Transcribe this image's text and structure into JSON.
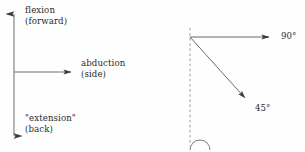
{
  "figure": {
    "name": "joint-motion-direction-diagram",
    "background_color": "#fefefe",
    "stroke_color": "#3a3a3a",
    "text_color": "#2b2b2b",
    "width": 305,
    "height": 152
  },
  "left_diagram": {
    "name": "axis-direction-diagram",
    "vertical_axis": {
      "name": "flexion-extension-axis",
      "x": 14,
      "y_top": 8,
      "y_bottom": 142,
      "arrowheads": "both"
    },
    "horizontal_axis": {
      "name": "abduction-axis",
      "y": 72,
      "x_start": 14,
      "x_end": 78,
      "arrowheads": "end"
    },
    "labels": {
      "flexion": {
        "line1": "flexion",
        "line2": "(forward)"
      },
      "abduction": {
        "line1": "abduction",
        "line2": "(side)"
      },
      "extension": {
        "line1": "\"extension\"",
        "line2": "(back)"
      }
    }
  },
  "right_diagram": {
    "name": "angle-measurement-diagram",
    "vertex": {
      "x": 190,
      "y": 37
    },
    "reference_line": {
      "name": "vertical-dashed-reference-line",
      "x": 190,
      "y_top": 28,
      "y_bottom": 145,
      "style": "dashed"
    },
    "rays": [
      {
        "name": "ninety-degree-ray",
        "x_end": 275,
        "y_end": 37,
        "angle": "90°"
      },
      {
        "name": "forty-five-degree-ray",
        "x_end": 250,
        "y_end": 103,
        "angle": "45°"
      }
    ],
    "arc_marker": {
      "name": "zero-degree-arc-marker",
      "center_x": 200,
      "center_y": 150,
      "radius": 10
    },
    "labels": {
      "ninety": "90°",
      "fortyfive": "45°"
    }
  }
}
